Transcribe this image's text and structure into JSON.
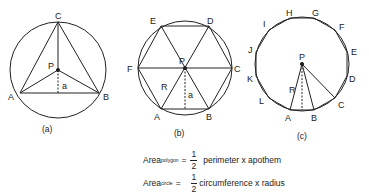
{
  "figures": {
    "a": {
      "caption": "(a)",
      "labels": {
        "A": "A",
        "B": "B",
        "C": "C",
        "P": "P",
        "a": "a"
      }
    },
    "b": {
      "caption": "(b)",
      "labels": {
        "A": "A",
        "B": "B",
        "C": "C",
        "D": "D",
        "E": "E",
        "F": "F",
        "P": "P",
        "R": "R",
        "a": "a"
      }
    },
    "c": {
      "caption": "(c)",
      "labels": {
        "A": "A",
        "B": "B",
        "C": "C",
        "D": "D",
        "E": "E",
        "F": "F",
        "G": "G",
        "H": "H",
        "I": "I",
        "J": "J",
        "K": "K",
        "L": "L",
        "P": "P",
        "R": "R"
      }
    }
  },
  "formulas": {
    "polygon": {
      "word": "Area",
      "subscript": "polygon",
      "equals": "=",
      "numerator": "1",
      "denominator": "2",
      "rest": "perimeter x apothem"
    },
    "circle": {
      "word": "Area",
      "subscript": "circle",
      "equals": "=",
      "numerator": "1",
      "denominator": "2",
      "rest": "circumference x radius"
    }
  },
  "colors": {
    "stroke": "#222222",
    "background": "#ffffff"
  }
}
